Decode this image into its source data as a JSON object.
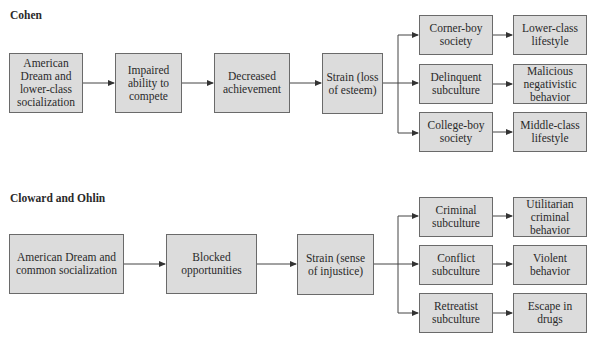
{
  "diagrams": [
    {
      "title": "Cohen",
      "nodes": {
        "n1": "American Dream and lower-class socialization",
        "n2": "Impaired ability to compete",
        "n3": "Decreased achievement",
        "n4": "Strain (loss of esteem)",
        "b1": "Corner-boy society",
        "b2": "Delinquent subculture",
        "b3": "College-boy society",
        "o1": "Lower-class lifestyle",
        "o2": "Malicious negativistic behavior",
        "o3": "Middle-class lifestyle"
      }
    },
    {
      "title": "Cloward and Ohlin",
      "nodes": {
        "n1": "American Dream and common socialization",
        "n2": "Blocked opportunities",
        "n3": "Strain (sense of injustice)",
        "b1": "Criminal subculture",
        "b2": "Conflict subculture",
        "b3": "Retreatist subculture",
        "o1": "Utilitarian criminal behavior",
        "o2": "Violent behavior",
        "o3": "Escape in drugs"
      }
    }
  ],
  "colors": {
    "box_fill": "#dcdcdc",
    "box_border": "#6a6a6a",
    "line": "#333333"
  }
}
